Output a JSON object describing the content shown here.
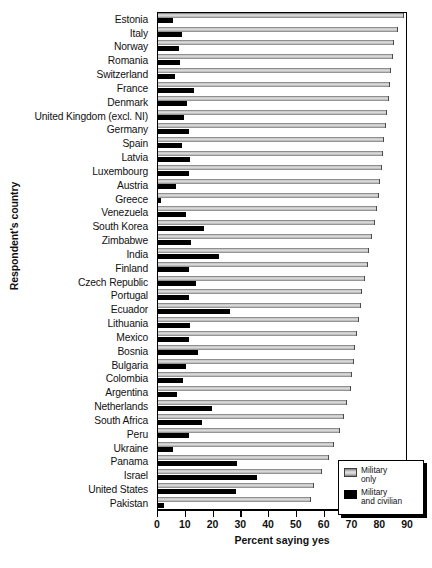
{
  "chart_data": {
    "type": "bar",
    "orientation": "horizontal",
    "title": "",
    "xlabel": "Percent saying yes",
    "ylabel": "Respondent's country",
    "xlim": [
      0,
      90
    ],
    "xticks": [
      0,
      10,
      20,
      30,
      40,
      50,
      60,
      70,
      80,
      90
    ],
    "grid": false,
    "legend_position": "bottom-right",
    "categories": [
      "Estonia",
      "Italy",
      "Norway",
      "Romania",
      "Switzerland",
      "France",
      "Denmark",
      "United Kingdom (excl. NI)",
      "Germany",
      "Spain",
      "Latvia",
      "Luxembourg",
      "Austria",
      "Greece",
      "Venezuela",
      "South Korea",
      "Zimbabwe",
      "India",
      "Finland",
      "Czech Republic",
      "Portugal",
      "Ecuador",
      "Lithuania",
      "Mexico",
      "Bosnia",
      "Bulgaria",
      "Colombia",
      "Argentina",
      "Netherlands",
      "South Africa",
      "Peru",
      "Ukraine",
      "Panama",
      "Israel",
      "United States",
      "Pakistan"
    ],
    "series": [
      {
        "name": "Military only",
        "color": "#cccccc",
        "values": [
          88.5,
          86.5,
          85.0,
          84.5,
          84.0,
          83.5,
          83.0,
          82.5,
          82.0,
          81.5,
          81.0,
          80.5,
          80.0,
          79.5,
          79.0,
          78.0,
          77.0,
          76.0,
          75.5,
          74.5,
          73.5,
          73.0,
          72.5,
          71.5,
          71.0,
          70.5,
          70.0,
          69.5,
          68.0,
          67.0,
          65.5,
          63.5,
          61.5,
          59.0,
          56.0,
          55.0
        ]
      },
      {
        "name": "Military and civilian",
        "color": "#000000",
        "values": [
          5.5,
          8.5,
          7.5,
          8.0,
          6.0,
          13.0,
          10.5,
          9.5,
          11.0,
          8.5,
          11.5,
          11.0,
          6.5,
          1.0,
          10.0,
          16.5,
          12.0,
          22.0,
          11.0,
          13.5,
          11.0,
          26.0,
          11.5,
          11.0,
          14.5,
          10.0,
          9.0,
          7.0,
          19.5,
          16.0,
          11.0,
          5.5,
          28.5,
          35.5,
          28.0,
          2.0
        ]
      }
    ],
    "legend": [
      {
        "label_line1": "Military",
        "label_line2": "only",
        "swatch": "gray"
      },
      {
        "label_line1": "Military",
        "label_line2": "and civilian",
        "swatch": "black"
      }
    ]
  }
}
